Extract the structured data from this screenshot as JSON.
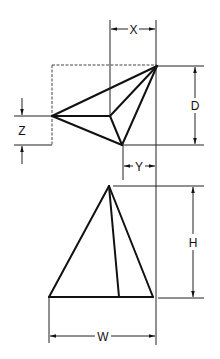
{
  "diagram": {
    "colors": {
      "line": "#111111",
      "background": "#ffffff"
    },
    "top_view": {
      "vertices": {
        "apex": [
          157,
          66
        ],
        "left": [
          52,
          116
        ],
        "inner": [
          110,
          116
        ],
        "bottom": [
          122,
          145
        ]
      }
    },
    "front_view": {
      "vertices": {
        "apex": [
          109,
          186
        ],
        "base_left": [
          49,
          297
        ],
        "base_right": [
          153,
          297
        ],
        "inner_base": [
          119,
          297
        ]
      }
    },
    "dimensions": {
      "x": {
        "label": "X"
      },
      "d": {
        "label": "D"
      },
      "z": {
        "label": "Z"
      },
      "y": {
        "label": "Y"
      },
      "h": {
        "label": "H"
      },
      "w": {
        "label": "W"
      }
    }
  }
}
